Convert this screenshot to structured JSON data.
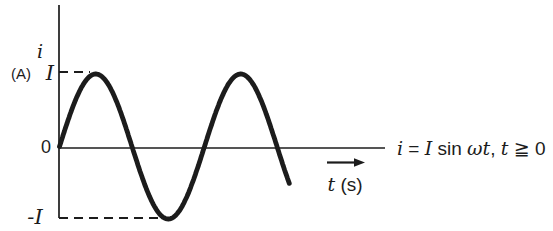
{
  "colors": {
    "ink": "#1c1c1c",
    "background": "#ffffff"
  },
  "chart_data": {
    "type": "line",
    "title": "",
    "function_label": "i = I sin ωt, t ≧ 0",
    "xlabel": "t (s)",
    "ylabel": "i (A)",
    "y_ticks": [
      "I",
      "0",
      "-I"
    ],
    "amplitude": 1,
    "domain_cycles": [
      0,
      1.585
    ],
    "grid": false,
    "key_points": [
      {
        "phase_cycles": 0.0,
        "i_over_I": 0
      },
      {
        "phase_cycles": 0.25,
        "i_over_I": 1
      },
      {
        "phase_cycles": 0.5,
        "i_over_I": 0
      },
      {
        "phase_cycles": 0.75,
        "i_over_I": -1
      },
      {
        "phase_cycles": 1.0,
        "i_over_I": 0
      },
      {
        "phase_cycles": 1.25,
        "i_over_I": 1
      },
      {
        "phase_cycles": 1.5,
        "i_over_I": 0
      }
    ]
  },
  "labels": {
    "y_axis_symbol": "i",
    "y_axis_unit": "(A)",
    "tick_positive": "I",
    "tick_zero": "0",
    "tick_negative": "-I",
    "x_axis": {
      "parts": [
        "t",
        " (s)"
      ]
    },
    "equation": {
      "parts": [
        "i",
        " = ",
        "I",
        " sin ",
        "ωt",
        ", ",
        "t",
        " ≧ 0"
      ]
    }
  }
}
